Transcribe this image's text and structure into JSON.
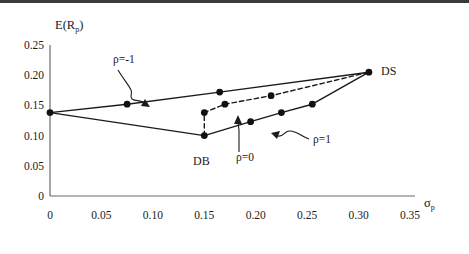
{
  "chart_data": {
    "type": "line",
    "title": "",
    "ylabel": "E(Rp)",
    "ylabel_base": "E(R",
    "ylabel_sub": "p",
    "ylabel_close": ")",
    "xlabel": "σp",
    "xlabel_base": "σ",
    "xlabel_sub": "p",
    "xlim": [
      0,
      0.35
    ],
    "ylim": [
      0,
      0.25
    ],
    "grid": false,
    "legend": "annotations",
    "xticks": [
      "0",
      "0.05",
      "0.10",
      "0.15",
      "0.20",
      "0.25",
      "0.30",
      "0.35"
    ],
    "xtickvalues": [
      0,
      0.05,
      0.1,
      0.15,
      0.2,
      0.25,
      0.3,
      0.35
    ],
    "yticks": [
      "0",
      "0.05",
      "0.10",
      "0.15",
      "0.20",
      "0.25"
    ],
    "ytickvalues": [
      0,
      0.05,
      0.1,
      0.15,
      0.2,
      0.25
    ],
    "series": [
      {
        "name": "ρ=-1",
        "style": "solid",
        "description": "upper efficient leg from single-asset DB-side endpoint to DS",
        "points": [
          {
            "x": 0.0,
            "y": 0.138
          },
          {
            "x": 0.075,
            "y": 0.152
          },
          {
            "x": 0.165,
            "y": 0.172
          },
          {
            "x": 0.31,
            "y": 0.205
          }
        ]
      },
      {
        "name": "ρ=-1 lower",
        "style": "solid",
        "description": "lower leg of the perfectly negative correlation frontier",
        "points": [
          {
            "x": 0.0,
            "y": 0.138
          },
          {
            "x": 0.15,
            "y": 0.1
          }
        ]
      },
      {
        "name": "ρ=0",
        "style": "dashed",
        "description": "zero-correlation frontier bulging left of the rho=1 line",
        "points": [
          {
            "x": 0.15,
            "y": 0.1
          },
          {
            "x": 0.15,
            "y": 0.138
          },
          {
            "x": 0.17,
            "y": 0.152
          },
          {
            "x": 0.215,
            "y": 0.166
          },
          {
            "x": 0.31,
            "y": 0.205
          }
        ]
      },
      {
        "name": "ρ=1",
        "style": "solid",
        "description": "perfectly positive correlation straight segment",
        "points": [
          {
            "x": 0.15,
            "y": 0.1
          },
          {
            "x": 0.195,
            "y": 0.123
          },
          {
            "x": 0.225,
            "y": 0.138
          },
          {
            "x": 0.255,
            "y": 0.152
          },
          {
            "x": 0.31,
            "y": 0.205
          }
        ]
      }
    ],
    "markers": [
      {
        "x": 0.0,
        "y": 0.138,
        "label": ""
      },
      {
        "x": 0.075,
        "y": 0.152,
        "label": ""
      },
      {
        "x": 0.165,
        "y": 0.172,
        "label": ""
      },
      {
        "x": 0.15,
        "y": 0.1,
        "label": "DB"
      },
      {
        "x": 0.15,
        "y": 0.138,
        "label": ""
      },
      {
        "x": 0.17,
        "y": 0.152,
        "label": ""
      },
      {
        "x": 0.215,
        "y": 0.166,
        "label": ""
      },
      {
        "x": 0.195,
        "y": 0.123,
        "label": ""
      },
      {
        "x": 0.225,
        "y": 0.138,
        "label": ""
      },
      {
        "x": 0.255,
        "y": 0.152,
        "label": ""
      },
      {
        "x": 0.31,
        "y": 0.205,
        "label": "DS"
      }
    ],
    "annotations": [
      {
        "name": "rho-neg1",
        "text": "ρ=-1",
        "tx": 113,
        "ty": 63
      },
      {
        "name": "rho-0",
        "text": "ρ=0",
        "tx": 236,
        "ty": 161
      },
      {
        "name": "rho-1",
        "text": "ρ=1",
        "tx": 313,
        "ty": 143
      },
      {
        "name": "ds",
        "text": "DS",
        "tx": 381,
        "ty": 75
      },
      {
        "name": "db",
        "text": "DB",
        "tx": 193,
        "ty": 165
      }
    ],
    "colors": {
      "line": "#1a1a1a",
      "marker": "#111111",
      "axis": "#555555",
      "text": "#1a1a1a",
      "background": "#ffffff",
      "topbar": "#3a3a3a"
    }
  }
}
